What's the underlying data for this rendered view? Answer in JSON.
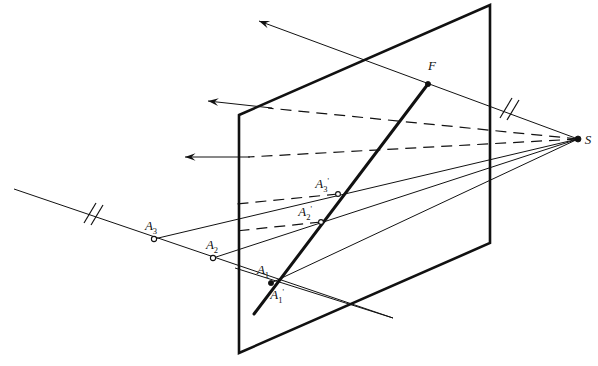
{
  "figure": {
    "background_color": "#ffffff",
    "ink_color": "#111111",
    "width": 598,
    "height": 366
  },
  "labels": [
    {
      "id": "F",
      "base": "F",
      "sub": "",
      "prime": "",
      "x": 432,
      "y": 70,
      "anchor": "middle"
    },
    {
      "id": "S",
      "base": "S",
      "sub": "",
      "prime": "",
      "x": 588,
      "y": 144,
      "anchor": "middle"
    },
    {
      "id": "A3s",
      "base": "A",
      "sub": "3",
      "prime": "'",
      "x": 322,
      "y": 188,
      "anchor": "middle"
    },
    {
      "id": "A2s",
      "base": "A",
      "sub": "2",
      "prime": "'",
      "x": 305,
      "y": 216,
      "anchor": "middle"
    },
    {
      "id": "A1",
      "base": "A",
      "sub": "1",
      "prime": "",
      "x": 263,
      "y": 274,
      "anchor": "middle"
    },
    {
      "id": "A1s",
      "base": "A",
      "sub": "1",
      "prime": "'",
      "x": 277,
      "y": 299,
      "anchor": "middle"
    },
    {
      "id": "A2",
      "base": "A",
      "sub": "2",
      "prime": "",
      "x": 212,
      "y": 249,
      "anchor": "middle"
    },
    {
      "id": "A3",
      "base": "A",
      "sub": "3",
      "prime": "",
      "x": 151,
      "y": 230,
      "anchor": "middle"
    }
  ],
  "points": [
    {
      "name": "S",
      "x": 578,
      "y": 139,
      "style": "dot"
    },
    {
      "name": "F",
      "x": 428,
      "y": 84,
      "style": "dot"
    },
    {
      "name": "A3-prime",
      "x": 338,
      "y": 194,
      "style": "ring"
    },
    {
      "name": "A2-prime",
      "x": 321,
      "y": 222,
      "style": "ring"
    },
    {
      "name": "A1-prime",
      "x": 271,
      "y": 283,
      "style": "ring"
    },
    {
      "name": "A3",
      "x": 154,
      "y": 239,
      "style": "ring"
    },
    {
      "name": "A2",
      "x": 213,
      "y": 258,
      "style": "ring"
    }
  ],
  "plane": {
    "name": "projection-plane",
    "corners": [
      {
        "x": 239,
        "y": 115
      },
      {
        "x": 490,
        "y": 5
      },
      {
        "x": 490,
        "y": 243
      },
      {
        "x": 239,
        "y": 353
      }
    ]
  },
  "lines": {
    "object_line": {
      "name": "object-line-A3-A2-A1",
      "from": {
        "x": 14,
        "y": 189
      },
      "to": {
        "x": 393,
        "y": 318
      },
      "tick_marks": 2,
      "tick_at": {
        "x": 90,
        "y": 215
      }
    },
    "image_line": {
      "name": "image-line-F-A1prime",
      "from": {
        "x": 428,
        "y": 84
      },
      "to": {
        "x": 254,
        "y": 314
      },
      "weight": "thick"
    },
    "projection_rays": [
      {
        "name": "ray-S-to-A1",
        "from": {
          "x": 578,
          "y": 139
        },
        "to": {
          "x": 271,
          "y": 283
        }
      },
      {
        "name": "ray-S-to-A2",
        "from": {
          "x": 578,
          "y": 139
        },
        "to": {
          "x": 213,
          "y": 258
        }
      },
      {
        "name": "ray-S-to-A3",
        "from": {
          "x": 578,
          "y": 139
        },
        "to": {
          "x": 154,
          "y": 239
        }
      },
      {
        "name": "ray-S-to-F-upper",
        "from": {
          "x": 578,
          "y": 139
        },
        "to": {
          "x": 428,
          "y": 84
        }
      }
    ],
    "ray_extension": {
      "name": "ray-S-through-F-extended",
      "from": {
        "x": 578,
        "y": 139
      },
      "to": {
        "x": 259,
        "y": 21
      },
      "arrow": true,
      "tick_marks": 2,
      "tick_at": {
        "x": 505,
        "y": 104
      }
    },
    "parallel_rays": [
      {
        "name": "parallel-ray-upper",
        "dashed_from": {
          "x": 578,
          "y": 139
        },
        "dashed_to": {
          "x": 268,
          "y": 108
        },
        "solid_to": {
          "x": 208,
          "y": 101
        },
        "arrow": true
      },
      {
        "name": "parallel-ray-lower",
        "dashed_from": {
          "x": 578,
          "y": 139
        },
        "dashed_to": {
          "x": 243,
          "y": 157
        },
        "solid_to": {
          "x": 185,
          "y": 157
        },
        "arrow": true
      },
      {
        "name": "parallel-ray-A3-dashed",
        "dashed_from": {
          "x": 338,
          "y": 194
        },
        "dashed_to": {
          "x": 239,
          "y": 204
        },
        "arrow": false
      },
      {
        "name": "parallel-ray-A2-dashed",
        "dashed_from": {
          "x": 321,
          "y": 222
        },
        "dashed_to": {
          "x": 239,
          "y": 231
        },
        "arrow": false
      }
    ],
    "cross_line_through_A1": {
      "name": "cross-line-through-A1-prime",
      "from": {
        "x": 235,
        "y": 268
      },
      "to": {
        "x": 393,
        "y": 318
      }
    }
  },
  "annotations": {
    "tick_style": "double-slash",
    "arrow_style": "open-barb",
    "dash_pattern": "11 7"
  }
}
